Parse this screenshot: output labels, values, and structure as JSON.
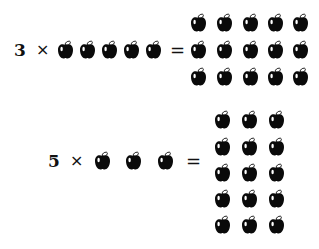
{
  "equations": [
    {
      "multiplier": "3",
      "times": "×",
      "equals": "=",
      "group_size": 5,
      "product_rows": 3,
      "product_cols": 5,
      "product_total": 15
    },
    {
      "multiplier": "5",
      "times": "×",
      "equals": "=",
      "group_size": 3,
      "product_rows": 5,
      "product_cols": 3,
      "product_total": 15
    }
  ],
  "icon": "apple-icon",
  "colors": {
    "apple": "#0a0a0a",
    "highlight": "#ffffff",
    "background": "#ffffff"
  }
}
